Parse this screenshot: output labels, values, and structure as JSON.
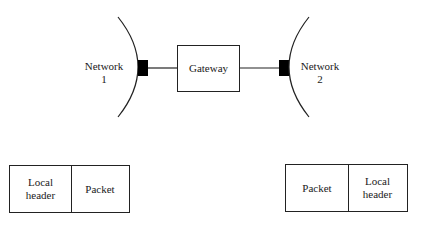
{
  "diagram": {
    "network1": {
      "name": "Network",
      "number": "1"
    },
    "network2": {
      "name": "Network",
      "number": "2"
    },
    "gateway": {
      "label": "Gateway"
    },
    "frame_left": {
      "cells": [
        {
          "line1": "Local",
          "line2": "header"
        },
        {
          "line1": "Packet",
          "line2": ""
        }
      ]
    },
    "frame_right": {
      "cells": [
        {
          "line1": "Packet",
          "line2": ""
        },
        {
          "line1": "Local",
          "line2": "header"
        }
      ]
    },
    "colors": {
      "stroke": "#222222",
      "fill_port": "#000000",
      "background": "#ffffff"
    }
  }
}
